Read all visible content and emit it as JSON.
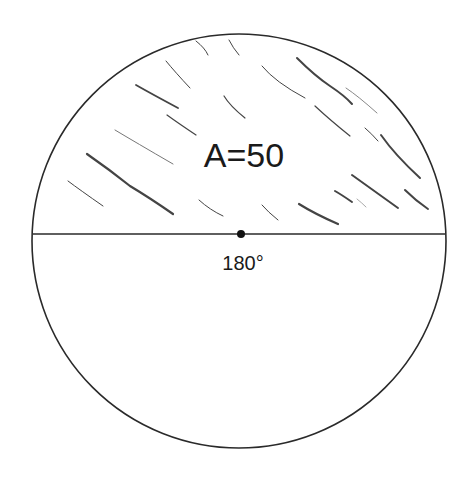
{
  "diagram": {
    "shape": "circle",
    "area_label": "A=50",
    "angle_label": "180°",
    "stroke_color": "#2a2a2a",
    "hatch_color": "#3a3a3a",
    "shaded_region": "upper semicircle"
  }
}
